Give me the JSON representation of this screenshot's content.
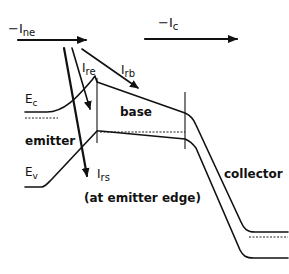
{
  "currents": {
    "ine": {
      "prefix": "−I",
      "sub": "ne"
    },
    "ic": {
      "prefix": "−I",
      "sub": "c"
    },
    "ire": {
      "prefix": "I",
      "sub": "re"
    },
    "irb": {
      "prefix": "I",
      "sub": "rb"
    },
    "irs": {
      "prefix": "I",
      "sub": "rs"
    }
  },
  "bands": {
    "ec": {
      "prefix": "E",
      "sub": "c"
    },
    "ev": {
      "prefix": "E",
      "sub": "v"
    }
  },
  "regions": {
    "emitter": "emitter",
    "base": "base",
    "collector": "collector"
  },
  "annotation": "(at emitter edge)",
  "colors": {
    "ink": "#111111",
    "background": "#ffffff"
  }
}
